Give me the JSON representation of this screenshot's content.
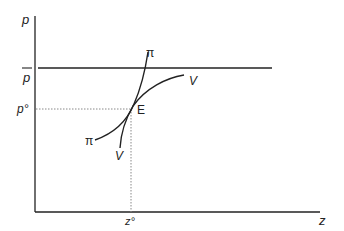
{
  "diagram": {
    "axes": {
      "y_label": "p",
      "x_label": "z"
    },
    "price_line_label": "p",
    "equilibrium_price_label": "p°",
    "equilibrium_quantity_label": "z°",
    "equilibrium_point_label": "E",
    "curves": [
      {
        "name": "pi",
        "label_top": "π",
        "label_bottom": "π"
      },
      {
        "name": "V",
        "label_top": "V",
        "label_bottom": "V"
      }
    ],
    "colors": {
      "line": "#222222",
      "dotted": "#888888"
    }
  }
}
